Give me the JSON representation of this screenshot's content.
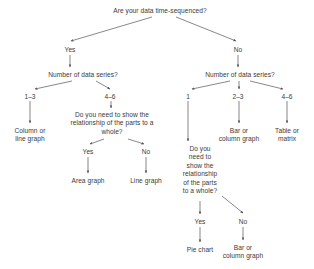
{
  "diagram": {
    "type": "flowchart",
    "background_color": "#ffffff",
    "text_color": "#3a3a3a",
    "edge_color": "#555555",
    "nodes": [
      {
        "id": "q_root",
        "kind": "question",
        "text": "Are your data time-sequenced?",
        "x": 160,
        "y": 7,
        "w": 130
      },
      {
        "id": "e_yes",
        "kind": "edge-label",
        "text": "Yes",
        "x": 70,
        "y": 46,
        "w": 24
      },
      {
        "id": "e_no",
        "kind": "edge-label",
        "text": "No",
        "x": 238,
        "y": 46,
        "w": 22
      },
      {
        "id": "q_series_l",
        "kind": "question",
        "text": "Number of data series?",
        "x": 83,
        "y": 71,
        "w": 100
      },
      {
        "id": "q_series_r",
        "kind": "question",
        "text": "Number of data series?",
        "x": 240,
        "y": 71,
        "w": 100
      },
      {
        "id": "e_l_13",
        "kind": "edge-label",
        "text": "1–3",
        "x": 30,
        "y": 93,
        "w": 22
      },
      {
        "id": "e_l_46",
        "kind": "edge-label",
        "text": "4–6",
        "x": 110,
        "y": 93,
        "w": 22
      },
      {
        "id": "e_r_1",
        "kind": "edge-label",
        "text": "1",
        "x": 188,
        "y": 93,
        "w": 16
      },
      {
        "id": "e_r_23",
        "kind": "edge-label",
        "text": "2–3",
        "x": 238,
        "y": 93,
        "w": 22
      },
      {
        "id": "e_r_46",
        "kind": "edge-label",
        "text": "4–6",
        "x": 287,
        "y": 93,
        "w": 22
      },
      {
        "id": "r_col_line",
        "kind": "result",
        "text": "Column or\nline graph",
        "x": 30,
        "y": 127,
        "w": 56
      },
      {
        "id": "q_parts_mid",
        "kind": "question",
        "text": "Do you need to show the\nrelationship of the parts to a\nwhole?",
        "x": 112,
        "y": 111,
        "w": 110
      },
      {
        "id": "e_mid_yes",
        "kind": "edge-label",
        "text": "Yes",
        "x": 88,
        "y": 148,
        "w": 24
      },
      {
        "id": "e_mid_no",
        "kind": "edge-label",
        "text": "No",
        "x": 146,
        "y": 148,
        "w": 22
      },
      {
        "id": "r_area",
        "kind": "result",
        "text": "Area graph",
        "x": 88,
        "y": 177,
        "w": 52
      },
      {
        "id": "r_line",
        "kind": "result",
        "text": "Line graph",
        "x": 146,
        "y": 177,
        "w": 52
      },
      {
        "id": "r_bar_col_r",
        "kind": "result",
        "text": "Bar or\ncolumn graph",
        "x": 239,
        "y": 127,
        "w": 62
      },
      {
        "id": "r_table",
        "kind": "result",
        "text": "Table or\nmatrix",
        "x": 287,
        "y": 127,
        "w": 48
      },
      {
        "id": "q_parts_right",
        "kind": "question",
        "text": "Do you\nneed to\nshow the\nrelationship\nof the parts\nto a whole?",
        "x": 200,
        "y": 145,
        "w": 56
      },
      {
        "id": "e_right_yes",
        "kind": "edge-label",
        "text": "Yes",
        "x": 200,
        "y": 218,
        "w": 24
      },
      {
        "id": "e_right_no",
        "kind": "edge-label",
        "text": "No",
        "x": 243,
        "y": 218,
        "w": 22
      },
      {
        "id": "r_pie",
        "kind": "result",
        "text": "Pie chart",
        "x": 200,
        "y": 246,
        "w": 46
      },
      {
        "id": "r_bar_col_b",
        "kind": "result",
        "text": "Bar or\ncolumn graph",
        "x": 243,
        "y": 244,
        "w": 62
      }
    ],
    "edges": [
      {
        "from": "q_root",
        "to": "e_yes",
        "x1": 152,
        "y1": 17,
        "x2": 71,
        "y2": 41
      },
      {
        "from": "q_root",
        "to": "e_no",
        "x1": 176,
        "y1": 17,
        "x2": 236,
        "y2": 41
      },
      {
        "from": "e_yes",
        "to": "q_series_l",
        "x1": 70,
        "y1": 55,
        "x2": 70,
        "y2": 67
      },
      {
        "from": "e_no",
        "to": "q_series_r",
        "x1": 238,
        "y1": 55,
        "x2": 238,
        "y2": 67
      },
      {
        "from": "q_series_l",
        "to": "e_l_13",
        "x1": 72,
        "y1": 81,
        "x2": 35,
        "y2": 89
      },
      {
        "from": "q_series_l",
        "to": "e_l_46",
        "x1": 96,
        "y1": 81,
        "x2": 110,
        "y2": 89
      },
      {
        "from": "q_series_r",
        "to": "e_r_1",
        "x1": 230,
        "y1": 81,
        "x2": 192,
        "y2": 89
      },
      {
        "from": "q_series_r",
        "to": "e_r_23",
        "x1": 239,
        "y1": 81,
        "x2": 239,
        "y2": 89
      },
      {
        "from": "q_series_r",
        "to": "e_r_46",
        "x1": 250,
        "y1": 81,
        "x2": 283,
        "y2": 89
      },
      {
        "from": "e_l_13",
        "to": "r_col_line",
        "x1": 30,
        "y1": 101,
        "x2": 30,
        "y2": 123
      },
      {
        "from": "e_l_46",
        "to": "q_parts_mid",
        "x1": 111,
        "y1": 101,
        "x2": 111,
        "y2": 108
      },
      {
        "from": "q_parts_mid",
        "to": "e_mid_yes",
        "x1": 104,
        "y1": 139,
        "x2": 90,
        "y2": 144
      },
      {
        "from": "q_parts_mid",
        "to": "e_mid_no",
        "x1": 128,
        "y1": 139,
        "x2": 144,
        "y2": 144
      },
      {
        "from": "e_mid_yes",
        "to": "r_area",
        "x1": 88,
        "y1": 157,
        "x2": 88,
        "y2": 173
      },
      {
        "from": "e_mid_no",
        "to": "r_line",
        "x1": 146,
        "y1": 157,
        "x2": 146,
        "y2": 173
      },
      {
        "from": "e_r_23",
        "to": "r_bar_col_r",
        "x1": 239,
        "y1": 101,
        "x2": 239,
        "y2": 123
      },
      {
        "from": "e_r_46",
        "to": "r_table",
        "x1": 287,
        "y1": 101,
        "x2": 287,
        "y2": 123
      },
      {
        "from": "e_r_1",
        "to": "q_parts_right",
        "x1": 188,
        "y1": 101,
        "x2": 188,
        "y2": 141
      },
      {
        "from": "q_parts_right",
        "to": "e_right_yes",
        "x1": 200,
        "y1": 201,
        "x2": 200,
        "y2": 214
      },
      {
        "from": "q_parts_right",
        "to": "e_right_no",
        "x1": 222,
        "y1": 196,
        "x2": 243,
        "y2": 213
      },
      {
        "from": "e_right_yes",
        "to": "r_pie",
        "x1": 200,
        "y1": 227,
        "x2": 200,
        "y2": 242
      },
      {
        "from": "e_right_no",
        "to": "r_bar_col_b",
        "x1": 243,
        "y1": 227,
        "x2": 243,
        "y2": 240
      }
    ]
  }
}
